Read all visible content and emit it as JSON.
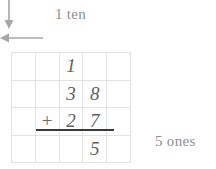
{
  "worksheet": {
    "title": "Vertical addition with regrouping",
    "annotations": {
      "carry_label": "1 ten",
      "ones_label": "5 ones"
    },
    "icons": {
      "down_arrow": "arrow-down-icon",
      "left_arrow": "arrow-left-icon"
    },
    "colors": {
      "grid_line": "#e2e2e2",
      "digit": "#5f5f5f",
      "annotation": "#8d8d8d",
      "sum_bar": "#3a3a3a"
    },
    "grid": {
      "columns": 5,
      "rows": 4,
      "cells": [
        [
          "",
          "",
          "1",
          "",
          ""
        ],
        [
          "",
          "",
          "3",
          "8",
          ""
        ],
        [
          "",
          "+",
          "2",
          "7",
          ""
        ],
        [
          "",
          "",
          "",
          "5",
          ""
        ]
      ]
    },
    "problem": {
      "addend_1": "38",
      "addend_2": "27",
      "carry": "1",
      "ones_digit": "5"
    }
  }
}
